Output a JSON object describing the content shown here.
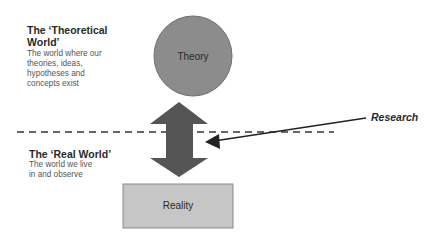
{
  "theoretical_world": {
    "heading": "The ‘Theoretical World’",
    "description": "The world where our theories, ideas, hypotheses and concepts exist"
  },
  "real_world": {
    "heading": "The ‘Real World’",
    "description": "The world we live in and observe"
  },
  "shapes": {
    "theory_label": "Theory",
    "reality_label": "Reality"
  },
  "annotation": {
    "research_label": "Research"
  },
  "colors": {
    "theory_fill": "#8c8c8c",
    "reality_fill": "#c6c6c6",
    "arrow_fill": "#555555",
    "line": "#222222"
  }
}
